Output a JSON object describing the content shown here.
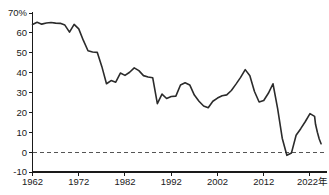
{
  "chart_data": {
    "type": "line",
    "title": "",
    "subtitle": "",
    "xlabel": "年",
    "ylabel": "",
    "xlim": [
      1962,
      2023
    ],
    "ylim": [
      -10,
      70
    ],
    "grid": false,
    "legend": null,
    "y_unit": "%",
    "y_ticks": [
      -10,
      0,
      10,
      20,
      30,
      40,
      50,
      60,
      70
    ],
    "y_tick_labels": [
      "-10",
      "0",
      "10",
      "20",
      "30",
      "40",
      "50",
      "60",
      "70%"
    ],
    "x_ticks": [
      1962,
      1972,
      1982,
      1992,
      2002,
      2012,
      2022
    ],
    "x_tick_labels": [
      "1962",
      "1972",
      "1982",
      "1992",
      "2002",
      "2012",
      "2022年"
    ],
    "reference_lines": [
      {
        "name": "zero-line",
        "y": 0,
        "style": "dashed",
        "color": "#555555"
      }
    ],
    "series": [
      {
        "name": "value",
        "color": "#2b2b2b",
        "x": [
          1962,
          1963,
          1964,
          1965,
          1966,
          1967,
          1968,
          1969,
          1970,
          1971,
          1972,
          1973,
          1974,
          1975,
          1976,
          1977,
          1978,
          1979,
          1980,
          1981,
          1982,
          1983,
          1984,
          1985,
          1986,
          1987,
          1988,
          1989,
          1990,
          1991,
          1992,
          1993,
          1994,
          1995,
          1996,
          1997,
          1998,
          1999,
          2000,
          2001,
          2002,
          2003,
          2004,
          2005,
          2006,
          2007,
          2008,
          2009,
          2010,
          2011,
          2012,
          2013,
          2014,
          2015,
          2016,
          2017,
          2018,
          2019,
          2020,
          2021,
          2022,
          2023
        ],
        "values": [
          64.2,
          65.3,
          64.4,
          65.0,
          65.2,
          64.9,
          64.8,
          63.9,
          60.4,
          64.3,
          62.0,
          56.2,
          51.0,
          50.4,
          50.2,
          43.0,
          34.4,
          36.0,
          35.2,
          39.8,
          38.6,
          40.2,
          42.4,
          41.0,
          38.5,
          37.8,
          37.4,
          24.4,
          29.2,
          27.0,
          28.0,
          28.2,
          33.8,
          34.9,
          33.8,
          28.7,
          25.6,
          23.2,
          22.3,
          25.6,
          27.2,
          28.4,
          28.8,
          31.0,
          34.2,
          37.6,
          41.5,
          38.4,
          30.5,
          25.2,
          26.0,
          29.6,
          34.4,
          22.0,
          7.0,
          -1.6,
          -0.4,
          8.5,
          11.8,
          15.4,
          19.4,
          18.0
        ]
      }
    ],
    "series_tail": {
      "x": [
        2023.2,
        2023.6,
        2024,
        2024.4
      ],
      "values": [
        14.0,
        10.0,
        6.6,
        4.2
      ]
    }
  }
}
